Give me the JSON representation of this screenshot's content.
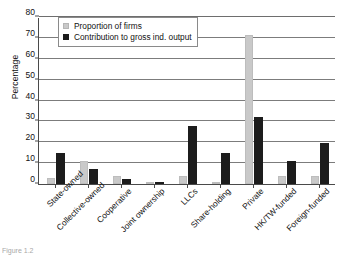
{
  "chart_data": {
    "type": "bar",
    "title": "",
    "xlabel": "",
    "ylabel": "Percentage",
    "ylim": [
      0,
      80
    ],
    "ytick_values": [
      0,
      10,
      20,
      30,
      40,
      50,
      60,
      70,
      80
    ],
    "ytick_labels": [
      "0",
      "10",
      "20",
      "30",
      "40",
      "50",
      "60",
      "70",
      "80"
    ],
    "grid": true,
    "legend_position": "top-left-inside",
    "categories": [
      "State-owned",
      "Collective-owned",
      "Cooperative",
      "Joint ownership",
      "LLCs",
      "Share-holding",
      "Private",
      "HK/TW-funded",
      "Foreign-funded"
    ],
    "series": [
      {
        "name": "Proportion of firms",
        "color": "#c9c9c9",
        "values": [
          3.0,
          11.0,
          4.0,
          0.4,
          4.0,
          0.8,
          71.5,
          4.0,
          4.0
        ]
      },
      {
        "name": "Contribution to gross ind. output",
        "color": "#1c1c1c",
        "values": [
          15.0,
          7.0,
          2.5,
          0.8,
          28.0,
          15.0,
          32.0,
          11.0,
          19.5
        ]
      }
    ]
  },
  "legend": {
    "items": [
      {
        "label": "Proportion of firms",
        "swatch": "light-gray-swatch"
      },
      {
        "label": "Contribution to gross ind. output",
        "swatch": "black-swatch"
      }
    ]
  },
  "caption": {
    "text": "Figure 1.2"
  }
}
